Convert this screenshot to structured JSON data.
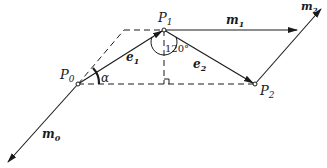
{
  "diagram": {
    "points": {
      "p0": {
        "label": "P",
        "sub": "0"
      },
      "p1": {
        "label": "P",
        "sub": "1"
      },
      "p2": {
        "label": "P",
        "sub": "2"
      }
    },
    "vectors": {
      "e1": {
        "label": "e",
        "sub": "1"
      },
      "e2": {
        "label": "e",
        "sub": "2"
      },
      "m0": {
        "label": "m",
        "sub": "0"
      },
      "m1": {
        "label": "m",
        "sub": "1"
      },
      "m2": {
        "label": "m",
        "sub": "2"
      }
    },
    "angles": {
      "alpha": "α",
      "p1_angle": "120°"
    },
    "colors": {
      "line": "#1a1a1a",
      "background": "#ffffff"
    }
  }
}
